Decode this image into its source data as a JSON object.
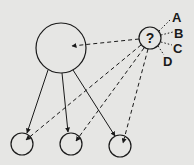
{
  "diagram": {
    "central_node": {
      "label": "?"
    },
    "options": [
      {
        "label": "A"
      },
      {
        "label": "B"
      },
      {
        "label": "C"
      },
      {
        "label": "D"
      }
    ],
    "parent_node": {
      "label": ""
    },
    "children": [
      {
        "label": ""
      },
      {
        "label": ""
      },
      {
        "label": ""
      }
    ],
    "colors": {
      "background": "#e6e6e4",
      "stroke": "#1a1a1a"
    }
  }
}
